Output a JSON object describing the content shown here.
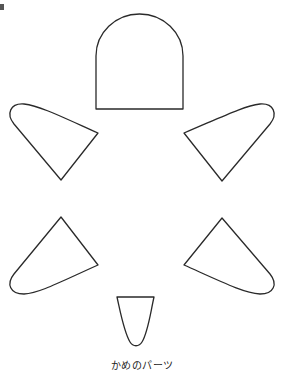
{
  "diagram": {
    "caption": "かめのパーツ",
    "stroke_color": "#2a2a2a",
    "fill_color": "#ffffff",
    "parts": [
      {
        "name": "head",
        "shape": "arch-rectangle"
      },
      {
        "name": "front-left-flipper",
        "shape": "teardrop"
      },
      {
        "name": "front-right-flipper",
        "shape": "teardrop"
      },
      {
        "name": "back-left-flipper",
        "shape": "teardrop"
      },
      {
        "name": "back-right-flipper",
        "shape": "teardrop"
      },
      {
        "name": "tail",
        "shape": "u-shape"
      }
    ]
  }
}
